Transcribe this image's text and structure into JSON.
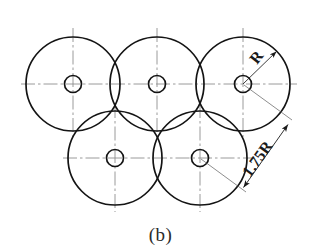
{
  "figure": {
    "caption": "(b)",
    "type": "engineering-drawing",
    "background_color": "#ffffff",
    "line_color": "#1a1a1a",
    "centerline_color": "#8a8a8a",
    "dimension_color": "#1a1a1a"
  },
  "geometry": {
    "big_circle_radius": 47,
    "small_circle_radius": 8,
    "centers": [
      {
        "name": "top-left",
        "cx": 73,
        "cy": 84
      },
      {
        "name": "top-middle",
        "cx": 157,
        "cy": 84
      },
      {
        "name": "top-right",
        "cx": 243,
        "cy": 84
      },
      {
        "name": "bottom-left",
        "cx": 115,
        "cy": 158
      },
      {
        "name": "bottom-right",
        "cx": 200,
        "cy": 158
      }
    ],
    "centerline_rows": [
      {
        "name": "top-row-axis",
        "y": 84,
        "x1": 21,
        "x2": 297
      },
      {
        "name": "bottom-row-axis",
        "y": 158,
        "x1": 63,
        "x2": 254
      }
    ],
    "centerline_columns": [
      {
        "name": "top-left-axis",
        "x": 73,
        "y1": 28,
        "y2": 137
      },
      {
        "name": "top-middle-axis",
        "x": 157,
        "y1": 28,
        "y2": 137
      },
      {
        "name": "top-right-axis",
        "x": 243,
        "y1": 28,
        "y2": 137
      },
      {
        "name": "bottom-left-axis",
        "x": 115,
        "y1": 104,
        "y2": 212
      },
      {
        "name": "bottom-right-axis",
        "x": 200,
        "y1": 104,
        "y2": 212
      }
    ]
  },
  "dimensions": [
    {
      "id": "radius-dim",
      "label": "R",
      "kind": "radius",
      "value": "R",
      "from": {
        "x": 243,
        "y": 84
      },
      "to": {
        "x": 277,
        "y": 51
      },
      "arrow_ends": "single",
      "label_rotation": -55,
      "label_position": {
        "x": 256,
        "y": 62
      }
    },
    {
      "id": "center-distance-dim",
      "label": "1.75R",
      "kind": "linear",
      "value": "1.75R",
      "from": {
        "x": 249,
        "y": 184
      },
      "to": {
        "x": 289,
        "y": 127
      },
      "arrow_ends": "double",
      "label_rotation": -55,
      "label_position": {
        "x": 262,
        "y": 162
      }
    }
  ]
}
